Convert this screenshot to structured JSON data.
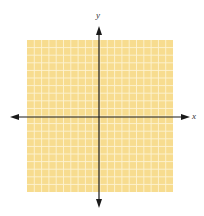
{
  "diagram": {
    "type": "coordinate-plane",
    "x_axis_label": "x",
    "y_axis_label": "y",
    "grid": {
      "columns": 20,
      "rows": 20,
      "fill_color": "#f7dc8f",
      "line_color": "#fdf3d2"
    },
    "axis_color": "#1a1a1a"
  }
}
